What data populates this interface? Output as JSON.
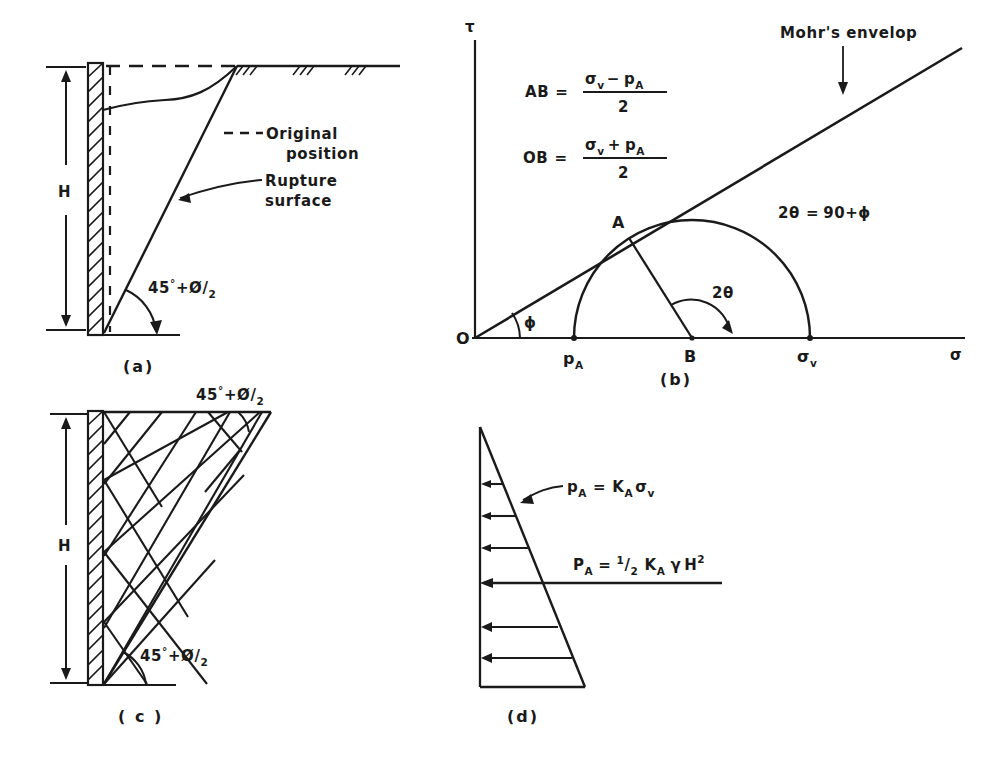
{
  "figure": {
    "ink_color": "#1a1a1a",
    "background": "#ffffff"
  },
  "panel_a": {
    "caption": "(a)",
    "height_label": "H",
    "original_position_label": "Original",
    "original_position_label2": "position",
    "original_position_dash": "- - -",
    "rupture_label": "Rupture",
    "rupture_label2": "surface",
    "angle_label_45": "45",
    "angle_label_deg": "°",
    "angle_label_plus": "+",
    "angle_label_phi": "Ø",
    "angle_label_slash": "/",
    "angle_label_2": "2"
  },
  "panel_b": {
    "caption": "(b)",
    "y_axis_label": "τ",
    "x_axis_label": "σ",
    "origin_label": "O",
    "point_a_label": "A",
    "point_b_label": "B",
    "point_pa_label": "p",
    "point_pa_sub": "A",
    "point_sigmav_label": "σ",
    "point_sigmav_sub": "v",
    "envelope_label": "Mohr's envelop",
    "phi_label": "ϕ",
    "two_theta_label": "2θ",
    "relation": {
      "lhs": "2θ",
      "eq": "=",
      "rhs": "90+ϕ",
      "full": "2θ = 90+ϕ"
    },
    "formula_ab": {
      "lhs": "AB",
      "eq": "=",
      "num_a": "σ",
      "num_a_sub": "v",
      "num_op": "−",
      "num_b": "p",
      "num_b_sub": "A",
      "denom": "2",
      "full": "AB = (σv − pA)/2"
    },
    "formula_ob": {
      "lhs": "OB",
      "eq": "=",
      "num_a": "σ",
      "num_a_sub": "v",
      "num_op": "+",
      "num_b": "p",
      "num_b_sub": "A",
      "denom": "2",
      "full": "OB = (σv + pA)/2"
    }
  },
  "panel_c": {
    "caption": "( c )",
    "height_label": "H",
    "angle_top_45": "45",
    "angle_top_deg": "°",
    "angle_top_plus": "+",
    "angle_top_phi": "Ø",
    "angle_top_slash": "/",
    "angle_top_2": "2",
    "angle_bottom_45": "45",
    "angle_bottom_deg": "°",
    "angle_bottom_plus": "+",
    "angle_bottom_phi": "Ø",
    "angle_bottom_slash": "/",
    "angle_bottom_2": "2"
  },
  "panel_d": {
    "caption": "(d)",
    "formula_pa_small": {
      "lhs": "p",
      "lhs_sub": "A",
      "eq": "=",
      "k": "K",
      "k_sub": "A",
      "sigma": "σ",
      "sigma_sub": "v",
      "full": "pA = KA σv"
    },
    "formula_pa_big": {
      "lhs": "P",
      "lhs_sub": "A",
      "eq": "=",
      "half_num": "1",
      "half_slash": "/",
      "half_den": "2",
      "k": "K",
      "k_sub": "A",
      "gamma": "γ",
      "h": "H",
      "h_sup": "2",
      "full": "PA = ½ KA γ H²"
    }
  }
}
